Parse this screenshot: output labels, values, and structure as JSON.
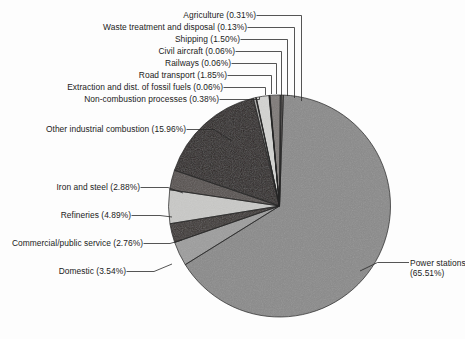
{
  "chart_data": {
    "type": "pie",
    "title": "",
    "subtitle": "",
    "xlabel": "",
    "ylabel": "",
    "legend_position": "none",
    "grid": false,
    "units": "percent",
    "total": 100.0,
    "categories": [
      "Power stations",
      "Domestic",
      "Commercial/public service",
      "Refineries",
      "Iron and steel",
      "Other industrial combustion",
      "Non-combustion processes",
      "Extraction and dist. of fossil fuels",
      "Road transport",
      "Railways",
      "Civil aircraft",
      "Shipping",
      "Waste treatment and disposal",
      "Agriculture"
    ],
    "values": [
      65.51,
      3.54,
      2.76,
      4.89,
      2.88,
      15.96,
      0.38,
      0.06,
      1.85,
      0.06,
      0.06,
      1.5,
      0.13,
      0.31
    ],
    "slices": [
      {
        "name": "Power stations",
        "value": 65.51,
        "label": "Power stations",
        "value_label": "(65.51%)",
        "color": "#8a8a8a"
      },
      {
        "name": "Domestic",
        "value": 3.54,
        "label": "Domestic (3.54%)",
        "color": "#9d9d9d"
      },
      {
        "name": "Commercial/public service",
        "value": 2.76,
        "label": "Commercial/public service (2.76%)",
        "color": "#3a3432"
      },
      {
        "name": "Refineries",
        "value": 4.89,
        "label": "Refineries (4.89%)",
        "color": "#c9c9c7"
      },
      {
        "name": "Iron and steel",
        "value": 2.88,
        "label": "Iron and steel (2.88%)",
        "color": "#56504e"
      },
      {
        "name": "Other industrial combustion",
        "value": 15.96,
        "label": "Other industrial combustion (15.96%)",
        "color": "#2b2524"
      },
      {
        "name": "Non-combustion processes",
        "value": 0.38,
        "label": "Non-combustion processes (0.38%)",
        "color": "#a8a8a6"
      },
      {
        "name": "Extraction and dist. of fossil fuels",
        "value": 0.06,
        "label": "Extraction and dist. of fossil fuels (0.06%)",
        "color": "#6e6866"
      },
      {
        "name": "Road transport",
        "value": 1.85,
        "label": "Road transport (1.85%)",
        "color": "#d3d3d1"
      },
      {
        "name": "Railways",
        "value": 0.06,
        "label": "Railways (0.06%)",
        "color": "#555050"
      },
      {
        "name": "Civil aircraft",
        "value": 0.06,
        "label": "Civil aircraft (0.06%)",
        "color": "#b5b5b3"
      },
      {
        "name": "Shipping",
        "value": 1.5,
        "label": "Shipping (1.50%)",
        "color": "#7e7977"
      },
      {
        "name": "Waste treatment and disposal",
        "value": 0.13,
        "label": "Waste treatment and disposal (0.13%)",
        "color": "#c0c0be"
      },
      {
        "name": "Agriculture",
        "value": 0.31,
        "label": "Agriculture (0.31%)",
        "color": "#6b6664"
      }
    ]
  },
  "labels": {
    "agriculture": "Agriculture (0.31%)",
    "waste": "Waste treatment and disposal (0.13%)",
    "shipping": "Shipping (1.50%)",
    "aircraft": "Civil aircraft (0.06%)",
    "railways": "Railways (0.06%)",
    "road": "Road transport (1.85%)",
    "extraction": "Extraction and dist. of fossil fuels (0.06%)",
    "noncombustion": "Non-combustion processes (0.38%)",
    "otherind": "Other industrial combustion (15.96%)",
    "ironsteel": "Iron and steel (2.88%)",
    "refineries": "Refineries (4.89%)",
    "commercial": "Commercial/public service (2.76%)",
    "domestic": "Domestic (3.54%)",
    "power_line1": "Power stations",
    "power_line2": "(65.51%)"
  }
}
